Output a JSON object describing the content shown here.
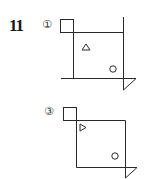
{
  "question": {
    "number": "11"
  },
  "figures": [
    {
      "label": "①",
      "shapes": {
        "inner_triangle": "up-triangle",
        "inner_circle": "circle"
      }
    },
    {
      "label": "③",
      "shapes": {
        "inner_triangle": "right-triangle",
        "inner_circle": "circle"
      }
    }
  ],
  "colors": {
    "line": "#2a2a2a",
    "background": "#ffffff"
  }
}
